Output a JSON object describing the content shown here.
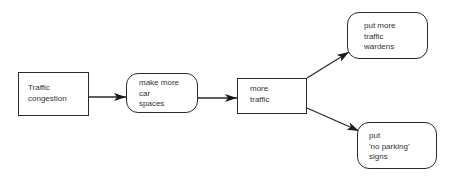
{
  "diagram": {
    "type": "flowchart",
    "nodes": [
      {
        "id": "n1",
        "shape": "rectangle",
        "text": "Traffic\ncongestion"
      },
      {
        "id": "n2",
        "shape": "rounded",
        "text": "make more\ncar\nspaces"
      },
      {
        "id": "n3",
        "shape": "rectangle",
        "text": "more\ntraffic"
      },
      {
        "id": "n4",
        "shape": "rounded",
        "text": "put more\ntraffic\nwardens"
      },
      {
        "id": "n5",
        "shape": "rounded",
        "text": "put\n'no parking'\nsigns"
      }
    ],
    "edges": [
      {
        "from": "n1",
        "to": "n2"
      },
      {
        "from": "n2",
        "to": "n3"
      },
      {
        "from": "n3",
        "to": "n4"
      },
      {
        "from": "n3",
        "to": "n5"
      }
    ],
    "colors": {
      "stroke": "#2a2a2a",
      "text": "#333333",
      "background": "#ffffff"
    }
  }
}
